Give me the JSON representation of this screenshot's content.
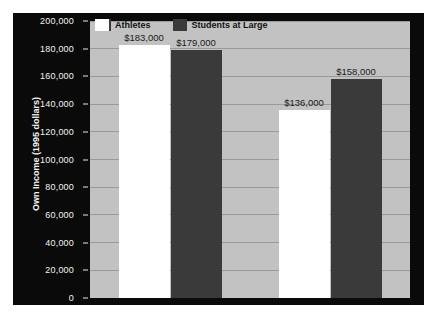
{
  "chart_data": {
    "type": "bar",
    "title": "",
    "subtitle": "",
    "xlabel": "",
    "ylabel": "Own Income (1995 dollars)",
    "categories": [
      "1951",
      "1976"
    ],
    "series": [
      {
        "name": "Athletes",
        "color": "#ffffff",
        "values": [
          183000,
          158000
        ],
        "values_display": [
          "$183,000",
          "$136,000"
        ]
      },
      {
        "name": "Students at Large",
        "color": "#3a3a3a",
        "values": [
          179000,
          158000
        ],
        "values_display": [
          "$179,000",
          "$158,000"
        ]
      }
    ],
    "points": [
      {
        "category": "1951",
        "series": "Athletes",
        "value": 183000,
        "label": "$183,000"
      },
      {
        "category": "1951",
        "series": "Students at Large",
        "value": 179000,
        "label": "$179,000"
      },
      {
        "category": "1976",
        "series": "Athletes",
        "value": 136000,
        "label": "$136,000"
      },
      {
        "category": "1976",
        "series": "Students at Large",
        "value": 158000,
        "label": "$158,000"
      }
    ],
    "ylim": [
      0,
      200000
    ],
    "ytick_values": [
      0,
      20000,
      40000,
      60000,
      80000,
      100000,
      120000,
      140000,
      160000,
      180000,
      200000
    ],
    "ytick_labels": [
      "0",
      "20,000",
      "40,000",
      "60,000",
      "80,000",
      "100,000",
      "120,000",
      "140,000",
      "160,000",
      "180,000",
      "200,000"
    ],
    "grid": true,
    "legend_position": "top",
    "legend": [
      {
        "label": "Athletes",
        "color": "#ffffff"
      },
      {
        "label": "Students at Large",
        "color": "#3a3a3a"
      }
    ],
    "colors": {
      "figure_background": "#0a0a0a",
      "plot_background": "#c2c2c2",
      "gridline": "#9a9a9a",
      "axis_text": "#f2f2f2",
      "data_label_text": "#1a1a1a",
      "page_background": "#ffffff"
    }
  }
}
